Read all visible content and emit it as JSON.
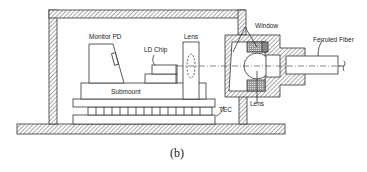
{
  "diagram": {
    "caption": "(b)",
    "labels": {
      "monitor_pd": "Monitor PD",
      "ld_chip": "LD Chip",
      "lens_left": "Lens",
      "submount": "Submount",
      "tec": "TEC",
      "window": "Window",
      "lens_right": "Lens",
      "ferruled_fiber": "Ferruled Fiber"
    },
    "colors": {
      "line": "#333333",
      "hatch": "#555555",
      "background": "#ffffff"
    }
  }
}
